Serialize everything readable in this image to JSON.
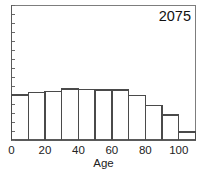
{
  "chart_data": {
    "type": "bar",
    "title": "2075",
    "xlabel": "Age",
    "ylabel": "",
    "categories": [
      "0",
      "10",
      "20",
      "30",
      "40",
      "50",
      "60",
      "70",
      "80",
      "90",
      "100"
    ],
    "bin_starts": [
      0,
      10,
      20,
      30,
      40,
      50,
      60,
      70,
      80,
      90,
      100
    ],
    "bin_width": 10,
    "values": [
      10.1,
      10.6,
      10.9,
      11.4,
      11.3,
      11.2,
      11.2,
      10.0,
      7.7,
      5.6,
      1.8
    ],
    "xlim": [
      0,
      110
    ],
    "ylim": [
      0,
      30
    ],
    "x_tick_labels": [
      "0",
      "20",
      "40",
      "60",
      "80",
      "100"
    ],
    "x_tick_values": [
      0,
      20,
      40,
      60,
      80,
      100
    ],
    "x_minor_tick_values": [
      0,
      10,
      20,
      30,
      40,
      50,
      60,
      70,
      80,
      90,
      100,
      110
    ],
    "y_tick_labels": [],
    "y_minor_tick_count": 15,
    "grid": false,
    "legend": null,
    "bar_style": "outline",
    "colors": {
      "bar_outline": "#4a4a4a",
      "axis": "#5a5a5a",
      "frame": "#7d7d7d",
      "text": "#222222",
      "background": "#ffffff"
    }
  },
  "figure": {
    "title_text": "2075",
    "x_axis_title": "Age"
  }
}
